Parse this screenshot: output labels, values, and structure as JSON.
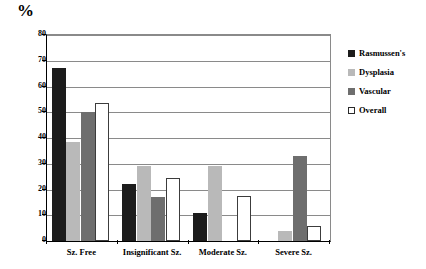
{
  "chart_data": {
    "type": "bar",
    "title": "",
    "xlabel": "",
    "ylabel": "%",
    "ylim": [
      0,
      80
    ],
    "ytick_step": 10,
    "yticks": [
      80,
      70,
      60,
      50,
      40,
      30,
      20,
      10,
      0
    ],
    "grid": true,
    "legend_position": "right",
    "categories": [
      "Sz. Free",
      "Insignificant Sz.",
      "Moderate Sz.",
      "Severe Sz."
    ],
    "series": [
      {
        "name": "Rasmussen's",
        "color": "#1c1c1c",
        "values": [
          67,
          22,
          11,
          0
        ]
      },
      {
        "name": "Dysplasia",
        "color": "#b9b9b9",
        "values": [
          38.5,
          29,
          29,
          4
        ]
      },
      {
        "name": "Vascular",
        "color": "#6e6e6e",
        "values": [
          50,
          17,
          0,
          33
        ]
      },
      {
        "name": "Overall",
        "color": "#ffffff",
        "values": [
          53.5,
          24.5,
          17.5,
          6
        ]
      }
    ]
  },
  "legend": {
    "items": [
      {
        "label": "Rasmussen's",
        "swatch": "legend-swatch-black"
      },
      {
        "label": "Dysplasia",
        "swatch": "legend-swatch-light-gray"
      },
      {
        "label": "Vascular",
        "swatch": "legend-swatch-dark-gray"
      },
      {
        "label": "Overall",
        "swatch": "legend-swatch-white"
      }
    ]
  }
}
